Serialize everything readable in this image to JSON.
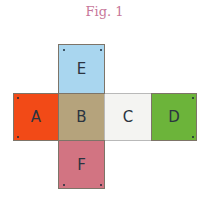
{
  "title": "Fig. 1",
  "faces": [
    {
      "label": "A",
      "color": "#f24a17",
      "x": 13,
      "y": 93,
      "w": 46,
      "h": 48
    },
    {
      "label": "B",
      "color": "#b5a37c",
      "x": 58,
      "y": 93,
      "w": 47,
      "h": 48
    },
    {
      "label": "C",
      "color": "#f4f4f2",
      "x": 104,
      "y": 93,
      "w": 48,
      "h": 48
    },
    {
      "label": "D",
      "color": "#6cb43a",
      "x": 151,
      "y": 93,
      "w": 46,
      "h": 48
    },
    {
      "label": "E",
      "color": "#a9d6ef",
      "x": 58,
      "y": 44,
      "w": 47,
      "h": 50
    },
    {
      "label": "F",
      "color": "#d27482",
      "x": 58,
      "y": 140,
      "w": 47,
      "h": 49
    }
  ],
  "dots": [
    {
      "face": "E",
      "x": 63,
      "y": 49
    },
    {
      "face": "E",
      "x": 100,
      "y": 49
    },
    {
      "face": "A",
      "x": 17,
      "y": 97
    },
    {
      "face": "A",
      "x": 17,
      "y": 136
    },
    {
      "face": "D",
      "x": 192,
      "y": 97
    },
    {
      "face": "D",
      "x": 192,
      "y": 136
    },
    {
      "face": "F",
      "x": 63,
      "y": 184
    },
    {
      "face": "F",
      "x": 100,
      "y": 184
    }
  ]
}
